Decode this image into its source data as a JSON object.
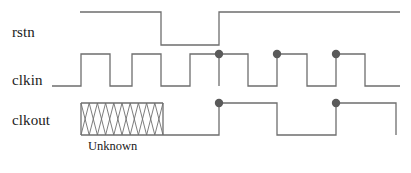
{
  "figure": {
    "type": "timing-diagram",
    "background_color": "#ffffff",
    "width": 411,
    "height": 173,
    "wave_color": "#6e6e6e",
    "hatch_color": "#6e6e6e",
    "marker_color": "#5a5a5a",
    "text_color": "#1a1a1a",
    "line_width": 1.3
  },
  "signals": [
    {
      "name": "rstn",
      "label": "rstn",
      "label_x": 12,
      "label_y": 24,
      "high_y": 12,
      "low_y": 45,
      "start_x": 80,
      "end_x": 400,
      "initial_level": "high",
      "transitions": [
        {
          "x": 161,
          "to": "low"
        },
        {
          "x": 219,
          "to": "high"
        }
      ],
      "markers": []
    },
    {
      "name": "clkin",
      "label": "clkin",
      "label_x": 12,
      "label_y": 72,
      "high_y": 54,
      "low_y": 86,
      "start_x": 52,
      "end_x": 400,
      "initial_level": "low",
      "transitions": [
        {
          "x": 81,
          "to": "high"
        },
        {
          "x": 110,
          "to": "low"
        },
        {
          "x": 132,
          "to": "high"
        },
        {
          "x": 161,
          "to": "low"
        },
        {
          "x": 190,
          "to": "high"
        },
        {
          "x": 219,
          "to": "low"
        },
        {
          "x": 219,
          "to": "high"
        },
        {
          "x": 248,
          "to": "low"
        },
        {
          "x": 277,
          "to": "high"
        },
        {
          "x": 307,
          "to": "low"
        },
        {
          "x": 336,
          "to": "high"
        },
        {
          "x": 365,
          "to": "low"
        }
      ],
      "markers": [
        {
          "x": 219,
          "y": 54,
          "r": 4.2
        },
        {
          "x": 277,
          "y": 54,
          "r": 4.2
        },
        {
          "x": 336,
          "y": 54,
          "r": 4.2
        }
      ]
    },
    {
      "name": "clkout",
      "label": "clkout",
      "label_x": 12,
      "label_y": 122,
      "high_y": 103,
      "low_y": 135,
      "start_x": 81,
      "end_x": 396,
      "initial_level": "low",
      "unknown_region": {
        "x1": 81,
        "x2": 163,
        "hatch_count": 10
      },
      "transitions": [
        {
          "x": 219,
          "to": "high"
        },
        {
          "x": 277,
          "to": "low"
        },
        {
          "x": 336,
          "to": "high"
        },
        {
          "x": 396,
          "to": "low"
        }
      ],
      "markers": [
        {
          "x": 219,
          "y": 103,
          "r": 4.2
        },
        {
          "x": 336,
          "y": 103,
          "r": 4.2
        }
      ]
    }
  ],
  "annotations": [
    {
      "name": "unknown-region-label",
      "text": "Unknown",
      "x": 88,
      "y": 144
    }
  ]
}
